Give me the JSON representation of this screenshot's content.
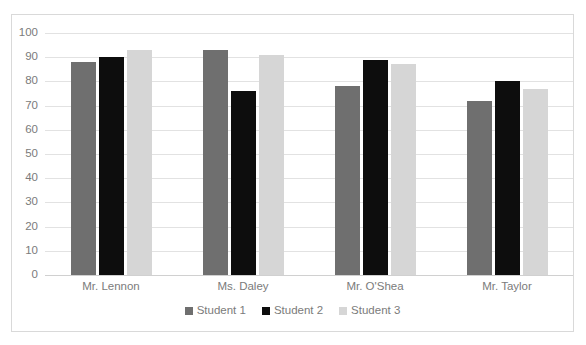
{
  "chart_data": {
    "type": "bar",
    "title": "",
    "xlabel": "",
    "ylabel": "",
    "ylim": [
      0,
      100
    ],
    "ytick_step": 10,
    "yticks": [
      "100",
      "90",
      "80",
      "70",
      "60",
      "50",
      "40",
      "30",
      "20",
      "10",
      "0"
    ],
    "grid": true,
    "legend_position": "bottom",
    "categories": [
      "Mr. Lennon",
      "Ms. Daley",
      "Mr. O'Shea",
      "Mr. Taylor"
    ],
    "series": [
      {
        "name": "Student 1",
        "color": "#6f6f6f",
        "values": [
          88,
          93,
          78,
          72
        ]
      },
      {
        "name": "Student 2",
        "color": "#0d0d0d",
        "values": [
          90,
          76,
          89,
          80
        ]
      },
      {
        "name": "Student 3",
        "color": "#d6d6d6",
        "values": [
          93,
          91,
          87,
          77
        ]
      }
    ]
  },
  "style": {
    "border_color": "#d9d9d9",
    "gridline_color": "#e2e2e2",
    "axis_text_color": "#7b7b7b",
    "background": "#ffffff"
  }
}
